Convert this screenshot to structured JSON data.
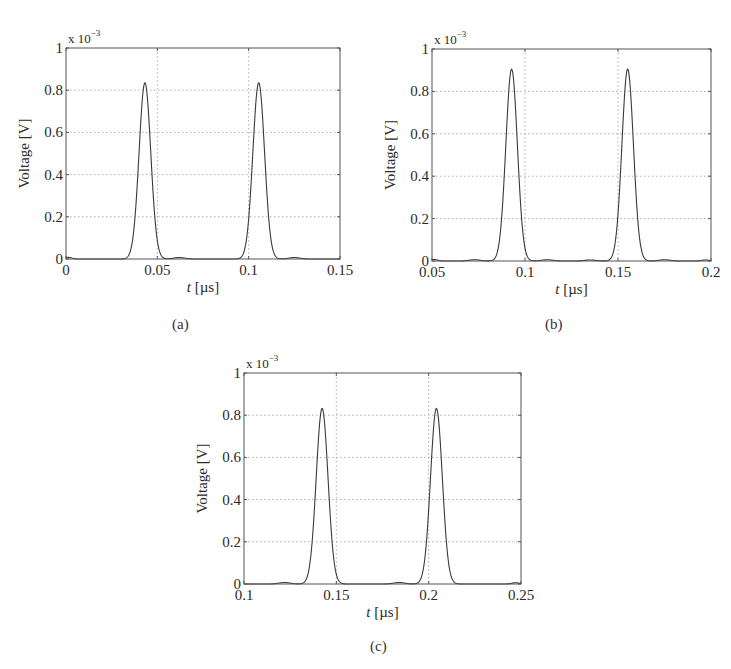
{
  "figure": {
    "background": "#ffffff",
    "line_color": "#3a3a3a",
    "grid_color": "#9a9a9a",
    "text_color": "#2a2a2a"
  },
  "chart_data": [
    {
      "id": "a",
      "type": "line",
      "caption": "(a)",
      "title": "",
      "xlabel_italic": "t",
      "xlabel_unit": "[µs]",
      "ylabel": "Voltage [V]",
      "y_multiplier": "x 10",
      "y_multiplier_exp": "−3",
      "xlim": [
        0,
        0.15
      ],
      "ylim": [
        0,
        1
      ],
      "xticks": [
        0,
        0.05,
        0.1,
        0.15
      ],
      "xtick_labels": [
        "0",
        "0.05",
        "0.1",
        "0.15"
      ],
      "yticks": [
        0,
        0.2,
        0.4,
        0.6,
        0.8,
        1
      ],
      "ytick_labels": [
        "0",
        "0.2",
        "0.4",
        "0.6",
        "0.8",
        "1"
      ],
      "grid": true,
      "legend": null,
      "box": {
        "x0": 66,
        "y0": 48,
        "x1": 340,
        "y1": 259
      },
      "caption_pos": {
        "x": 183,
        "y": 331
      },
      "series": [
        {
          "name": "voltage",
          "pulses": [
            {
              "center": 0.0432,
              "peak": 0.835,
              "sigma": 0.0032
            },
            {
              "center": 0.1055,
              "peak": 0.835,
              "sigma": 0.0032
            }
          ],
          "ripples": [
            {
              "center": 0.001,
              "peak": 0.008,
              "sigma": 0.002
            },
            {
              "center": 0.062,
              "peak": 0.007,
              "sigma": 0.003
            },
            {
              "center": 0.125,
              "peak": 0.007,
              "sigma": 0.003
            }
          ]
        }
      ]
    },
    {
      "id": "b",
      "type": "line",
      "caption": "(b)",
      "title": "",
      "xlabel_italic": "t",
      "xlabel_unit": "[µs]",
      "ylabel": "Voltage [V]",
      "y_multiplier": "x 10",
      "y_multiplier_exp": "−3",
      "xlim": [
        0.05,
        0.2
      ],
      "ylim": [
        0,
        1
      ],
      "xticks": [
        0.05,
        0.1,
        0.15,
        0.2
      ],
      "xtick_labels": [
        "0.05",
        "0.1",
        "0.15",
        "0.2"
      ],
      "yticks": [
        0,
        0.2,
        0.4,
        0.6,
        0.8,
        1
      ],
      "ytick_labels": [
        "0",
        "0.2",
        "0.4",
        "0.6",
        "0.8",
        "1"
      ],
      "grid": true,
      "legend": null,
      "box": {
        "x0": 432,
        "y0": 49,
        "x1": 711,
        "y1": 261
      },
      "caption_pos": {
        "x": 556,
        "y": 331
      },
      "series": [
        {
          "name": "voltage",
          "pulses": [
            {
              "center": 0.0928,
              "peak": 0.905,
              "sigma": 0.0031
            },
            {
              "center": 0.1552,
              "peak": 0.905,
              "sigma": 0.0031
            }
          ],
          "ripples": [
            {
              "center": 0.051,
              "peak": 0.007,
              "sigma": 0.002
            },
            {
              "center": 0.073,
              "peak": 0.006,
              "sigma": 0.003
            },
            {
              "center": 0.112,
              "peak": 0.006,
              "sigma": 0.003
            },
            {
              "center": 0.135,
              "peak": 0.005,
              "sigma": 0.003
            },
            {
              "center": 0.175,
              "peak": 0.006,
              "sigma": 0.003
            },
            {
              "center": 0.197,
              "peak": 0.005,
              "sigma": 0.002
            }
          ]
        }
      ]
    },
    {
      "id": "c",
      "type": "line",
      "caption": "(c)",
      "title": "",
      "xlabel_italic": "t",
      "xlabel_unit": "[µs]",
      "ylabel": "Voltage [V]",
      "y_multiplier": "x 10",
      "y_multiplier_exp": "−3",
      "xlim": [
        0.1,
        0.25
      ],
      "ylim": [
        0,
        1
      ],
      "xticks": [
        0.1,
        0.15,
        0.2,
        0.25
      ],
      "xtick_labels": [
        "0.1",
        "0.15",
        "0.2",
        "0.25"
      ],
      "yticks": [
        0,
        0.2,
        0.4,
        0.6,
        0.8,
        1
      ],
      "ytick_labels": [
        "0",
        "0.2",
        "0.4",
        "0.6",
        "0.8",
        "1"
      ],
      "grid": true,
      "legend": null,
      "box": {
        "x0": 244,
        "y0": 373,
        "x1": 521,
        "y1": 584
      },
      "caption_pos": {
        "x": 381,
        "y": 653
      },
      "series": [
        {
          "name": "voltage",
          "pulses": [
            {
              "center": 0.1423,
              "peak": 0.832,
              "sigma": 0.0032
            },
            {
              "center": 0.2042,
              "peak": 0.832,
              "sigma": 0.0032
            }
          ],
          "ripples": [
            {
              "center": 0.122,
              "peak": 0.007,
              "sigma": 0.003
            },
            {
              "center": 0.184,
              "peak": 0.007,
              "sigma": 0.003
            },
            {
              "center": 0.247,
              "peak": 0.006,
              "sigma": 0.002
            }
          ]
        }
      ]
    }
  ]
}
